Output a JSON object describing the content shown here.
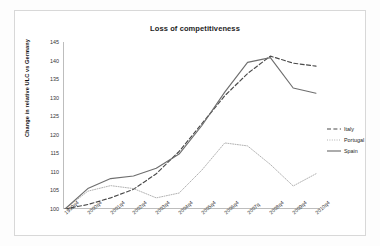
{
  "chart_data": {
    "type": "line",
    "title": "Loss of competitiveness",
    "xlabel": "",
    "ylabel": "Change in relative ULC vs Germany",
    "ylim": [
      100,
      145
    ],
    "ytick_step": 5,
    "yticks": [
      "100",
      "105",
      "110",
      "115",
      "120",
      "125",
      "130",
      "135",
      "140",
      "145"
    ],
    "grid": false,
    "legend_position": "right",
    "categories": [
      "1999q4",
      "2000q4",
      "2001q4",
      "2002q4",
      "2003q4",
      "2004q4",
      "2005q4",
      "2006q4",
      "2007q",
      "2008q4",
      "2009q4",
      "2010q4"
    ],
    "series": [
      {
        "name": "Italy",
        "style": "dashed",
        "color": "#4a4a4a",
        "values": [
          100.0,
          101.2,
          103.0,
          105.3,
          109.5,
          115.5,
          123.0,
          130.5,
          136.5,
          141.2,
          139.3,
          138.5
        ]
      },
      {
        "name": "Portugal",
        "style": "dotted",
        "color": "#a9a9a9",
        "values": [
          100.0,
          104.8,
          106.3,
          105.5,
          103.0,
          104.3,
          110.5,
          117.8,
          117.0,
          112.0,
          106.2,
          109.5
        ]
      },
      {
        "name": "Spain",
        "style": "solid",
        "color": "#6e6e6e",
        "values": [
          100.0,
          105.5,
          108.2,
          108.9,
          111.0,
          114.8,
          122.5,
          131.5,
          139.5,
          140.8,
          132.6,
          131.2
        ]
      }
    ]
  },
  "legend": {
    "items": [
      {
        "label": "Italy"
      },
      {
        "label": "Portugal"
      },
      {
        "label": "Spain"
      }
    ]
  }
}
